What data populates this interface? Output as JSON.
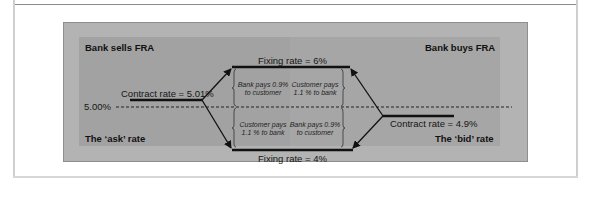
{
  "diagram": {
    "corners": {
      "top_left": "Bank sells FRA",
      "top_right": "Bank buys FRA",
      "bottom_left": "The ‘ask’ rate",
      "bottom_right": "The ‘bid’ rate"
    },
    "reference_rate": "5.00%",
    "fixing_high": "Fixing rate = 6%",
    "fixing_low": "Fixing rate = 4%",
    "contract_ask": "Contract rate = 5.01%",
    "contract_bid": "Contract rate = 4.9%",
    "notes": {
      "upper_left": [
        "Bank pays 0.9%",
        "to customer"
      ],
      "upper_right": [
        "Customer pays",
        "1.1 % to bank"
      ],
      "lower_left": [
        "Customer pays",
        "1.1 % to bank"
      ],
      "lower_right": [
        "Bank pays 0.9%",
        "to customer"
      ]
    },
    "colors": {
      "outer_bg": "#b3b3b3",
      "inner_bg": "#a2a2a2",
      "line": "#111111"
    }
  }
}
